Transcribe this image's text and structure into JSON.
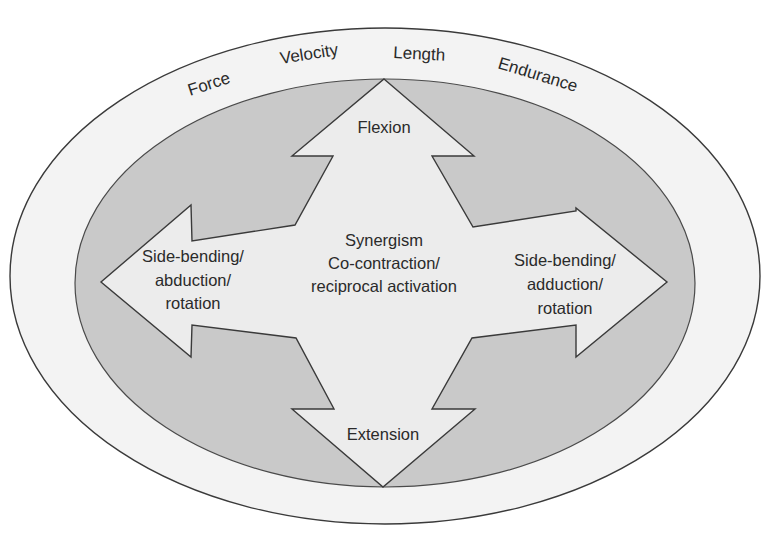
{
  "diagram": {
    "outer_ring_labels": [
      "Force",
      "Velocity",
      "Length",
      "Endurance"
    ],
    "arrows": {
      "top": {
        "label": "Flexion"
      },
      "bottom": {
        "label": "Extension"
      },
      "left": {
        "lines": [
          "Side-bending/",
          "abduction/",
          "rotation"
        ]
      },
      "right": {
        "lines": [
          "Side-bending/",
          "adduction/",
          "rotation"
        ]
      }
    },
    "center": {
      "lines": [
        "Synergism",
        "Co-contraction/",
        "reciprocal activation"
      ]
    },
    "colors": {
      "outer_ring_fill": "#f2f2f2",
      "inner_ellipse_fill": "#c8c8c8",
      "arrow_fill": "#ebebeb",
      "stroke": "#3a3a3a",
      "text": "#2a2a2a"
    }
  }
}
